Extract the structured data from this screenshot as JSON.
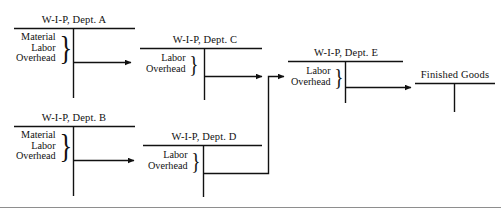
{
  "diagram": {
    "title_text": "",
    "line_color": "#111111",
    "page_rule_color": "#8e8e8e",
    "accounts": [
      {
        "id": "dept-a",
        "title": "W-I-P, Dept. A",
        "entries": [
          "Material",
          "Labor",
          "Overhead"
        ],
        "brace": "}"
      },
      {
        "id": "dept-b",
        "title": "W-I-P, Dept. B",
        "entries": [
          "Material",
          "Labor",
          "Overhead"
        ],
        "brace": "}"
      },
      {
        "id": "dept-c",
        "title": "W-I-P, Dept. C",
        "entries": [
          "Labor",
          "Overhead"
        ],
        "brace": "}"
      },
      {
        "id": "dept-d",
        "title": "W-I-P, Dept. D",
        "entries": [
          "Labor",
          "Overhead"
        ],
        "brace": "}"
      },
      {
        "id": "dept-e",
        "title": "W-I-P, Dept. E",
        "entries": [
          "Labor",
          "Overhead"
        ],
        "brace": "}"
      },
      {
        "id": "finished-goods",
        "title": "Finished Goods",
        "entries": [],
        "brace": ""
      }
    ],
    "flows": [
      {
        "from": "dept-a",
        "to": "dept-c"
      },
      {
        "from": "dept-b",
        "to": "dept-d"
      },
      {
        "from": "dept-c",
        "to": "dept-e"
      },
      {
        "from": "dept-d",
        "to": "dept-e"
      },
      {
        "from": "dept-e",
        "to": "finished-goods"
      }
    ]
  }
}
